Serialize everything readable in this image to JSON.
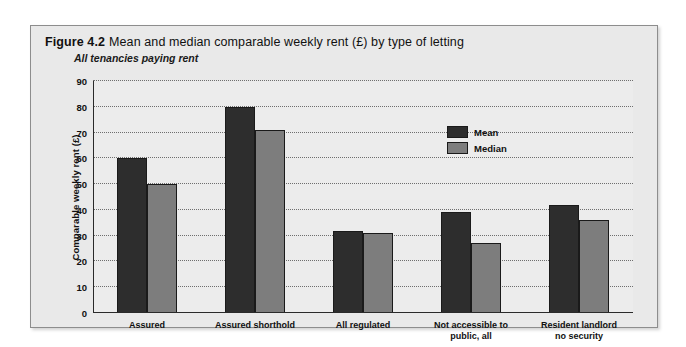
{
  "figure": {
    "number_label": "Figure 4.2",
    "title": "Mean and median comparable weekly rent (£) by type of letting",
    "subtitle": "All tenancies paying rent"
  },
  "legend": {
    "position": "inside-top-right",
    "items": [
      {
        "label": "Mean",
        "color": "#2d2d2d"
      },
      {
        "label": "Median",
        "color": "#7d7d7d"
      }
    ]
  },
  "chart_data": {
    "type": "bar",
    "title": "Mean and median comparable weekly rent (£) by type of letting",
    "subtitle": "All tenancies paying rent",
    "xlabel": "",
    "ylabel": "Comparable weekly rent (£)",
    "ylim": [
      0,
      90
    ],
    "ytick_step": 10,
    "yticks": [
      0,
      10,
      20,
      30,
      40,
      50,
      60,
      70,
      80,
      90
    ],
    "ytick_labels": [
      "0",
      "10",
      "20",
      "30",
      "40",
      "50",
      "60",
      "70",
      "80",
      "90"
    ],
    "grid": true,
    "grid_style": "dotted-horizontal",
    "legend_position": "upper right",
    "categories": [
      "Assured",
      "Assured shorthold",
      "All regulated",
      "Not accessible to\npublic, all",
      "Resident landlord\nno security"
    ],
    "category_lines": [
      [
        "Assured"
      ],
      [
        "Assured shorthold"
      ],
      [
        "All regulated"
      ],
      [
        "Not accessible to",
        "public, all"
      ],
      [
        "Resident landlord",
        "no security"
      ]
    ],
    "series": [
      {
        "name": "Mean",
        "color": "#2d2d2d",
        "values": [
          60,
          80,
          32,
          39,
          42
        ]
      },
      {
        "name": "Median",
        "color": "#7d7d7d",
        "values": [
          50,
          71,
          31,
          27,
          36
        ]
      }
    ]
  }
}
